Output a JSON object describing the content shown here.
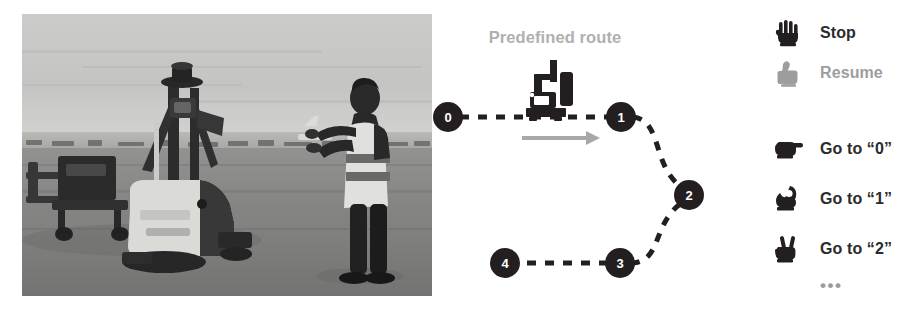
{
  "photo": {
    "alt": "Airport apron scene: autonomous tow tractor with sensor mast and a worker in a high-visibility vest gesturing toward it",
    "scene_elements": [
      "autonomous-tow-tractor",
      "sensor-mast",
      "trailer-dolly",
      "worker-high-vis-vest",
      "tarmac",
      "horizon-sky"
    ]
  },
  "route": {
    "title": "Predefined route",
    "title_color": "#b0b0b0",
    "node_color": "#231f20",
    "path_color": "#231f20",
    "arrow_color": "#a8a8a8",
    "nodes": [
      {
        "label": "0",
        "x": 18,
        "y": 117
      },
      {
        "label": "1",
        "x": 191,
        "y": 117
      },
      {
        "label": "2",
        "x": 259,
        "y": 195
      },
      {
        "label": "3",
        "x": 190,
        "y": 263
      },
      {
        "label": "4",
        "x": 75,
        "y": 263
      }
    ],
    "vehicle_icon": "agv-robot-icon",
    "direction_icon": "right-arrow-icon"
  },
  "legend": {
    "items": [
      {
        "icon": "open-palm-hand-icon",
        "label": "Stop",
        "muted": false,
        "top": 16
      },
      {
        "icon": "thumbs-up-hand-icon",
        "label": "Resume",
        "muted": true,
        "top": 56
      },
      {
        "icon": "pointing-finger-hand-icon",
        "label": "Go to “0”",
        "muted": false,
        "top": 132
      },
      {
        "icon": "ok-sign-hand-icon",
        "label": "Go to “1”",
        "muted": false,
        "top": 182
      },
      {
        "icon": "victory-two-fingers-hand-icon",
        "label": "Go to “2”",
        "muted": false,
        "top": 232
      }
    ],
    "ellipsis": "•••",
    "active_color": "#2b2b2b",
    "muted_color": "#9d9d9d"
  }
}
